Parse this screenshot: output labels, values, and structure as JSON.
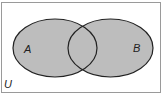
{
  "diagram": {
    "type": "venn",
    "universe": {
      "label": "U"
    },
    "sets": [
      {
        "id": "A",
        "label": "A",
        "shaded": true
      },
      {
        "id": "B",
        "label": "B",
        "shaded": true
      }
    ],
    "colors": {
      "fill": "#bdbdbd",
      "stroke": "#222222",
      "border": "#9a9a9a",
      "background": "#ffffff"
    }
  }
}
